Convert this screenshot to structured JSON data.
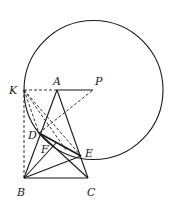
{
  "figure": {
    "circle": {
      "cx": 93.5,
      "cy": 90,
      "r": 69.5
    },
    "points": {
      "K": {
        "x": 24,
        "y": 90,
        "label": "K",
        "lx": 9,
        "ly": 94
      },
      "A": {
        "x": 57,
        "y": 90,
        "label": "A",
        "lx": 53,
        "ly": 85
      },
      "P": {
        "x": 93,
        "y": 90,
        "label": "P",
        "lx": 95,
        "ly": 85
      },
      "D": {
        "x": 39,
        "y": 133,
        "label": "D",
        "lx": 28,
        "ly": 139
      },
      "F": {
        "x": 51,
        "y": 146,
        "label": "F",
        "lx": 41,
        "ly": 153
      },
      "E": {
        "x": 81,
        "y": 156,
        "label": "E",
        "lx": 85,
        "ly": 157
      },
      "B": {
        "x": 24,
        "y": 178,
        "label": "B",
        "lx": 17,
        "ly": 196
      },
      "C": {
        "x": 88,
        "y": 178,
        "label": "C",
        "lx": 87,
        "ly": 196
      }
    },
    "labels": [
      "K",
      "A",
      "P",
      "D",
      "F",
      "E",
      "B",
      "C"
    ]
  }
}
